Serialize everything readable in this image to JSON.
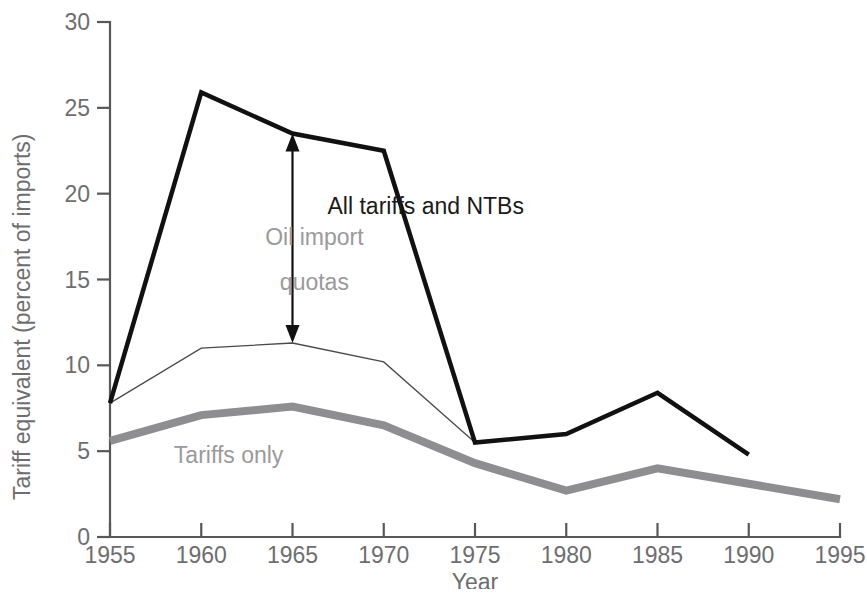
{
  "chart_data": {
    "type": "line",
    "title": "",
    "xlabel": "Year",
    "ylabel": "Tariff equivalent (percent of imports)",
    "xlim": [
      1955,
      1995
    ],
    "ylim": [
      0,
      30
    ],
    "xticks": [
      1955,
      1960,
      1965,
      1970,
      1975,
      1980,
      1985,
      1990,
      1995
    ],
    "yticks": [
      0,
      5,
      10,
      15,
      20,
      25,
      30
    ],
    "grid": false,
    "legend_position": "inline-annotations",
    "x": [
      1955,
      1960,
      1965,
      1970,
      1975,
      1980,
      1985,
      1990,
      1995
    ],
    "series": [
      {
        "name": "All tariffs and NTBs",
        "color": "#111111",
        "width": 4.5,
        "x": [
          1955,
          1960,
          1965,
          1970,
          1975,
          1980,
          1985,
          1990
        ],
        "values": [
          7.8,
          25.9,
          23.5,
          22.5,
          5.5,
          6.0,
          8.4,
          4.8
        ]
      },
      {
        "name": "Tariffs and NTBs excluding oil import quotas",
        "color": "#4a4a4c",
        "width": 1.3,
        "x": [
          1955,
          1960,
          1965,
          1970,
          1975
        ],
        "values": [
          7.8,
          11.0,
          11.3,
          10.2,
          5.5
        ]
      },
      {
        "name": "Tariffs only",
        "color": "#8e8e90",
        "width": 8.0,
        "x": [
          1955,
          1960,
          1965,
          1970,
          1975,
          1980,
          1985,
          1990,
          1995
        ],
        "values": [
          5.6,
          7.1,
          7.6,
          6.5,
          4.3,
          2.7,
          4.0,
          3.1,
          2.2
        ]
      }
    ],
    "annotations": [
      {
        "id": "oil-import-quotas",
        "text_line1": "Oil import",
        "text_line2": "quotas",
        "color": "#9a9a9c",
        "arrow_x": 1965,
        "arrow_y_top": 23.5,
        "arrow_y_bottom": 11.3,
        "label_x": 1966.2,
        "label_y1": 17.0,
        "label_y2": 14.4
      },
      {
        "id": "all-tariffs-and-ntbs",
        "text": "All tariffs and NTBs",
        "color": "#1a1a1a",
        "x": 1972.3,
        "y": 18.8
      },
      {
        "id": "tariffs-only",
        "text": "Tariffs only",
        "color": "#9a9a9c",
        "x": 1961.5,
        "y": 4.3
      }
    ]
  }
}
